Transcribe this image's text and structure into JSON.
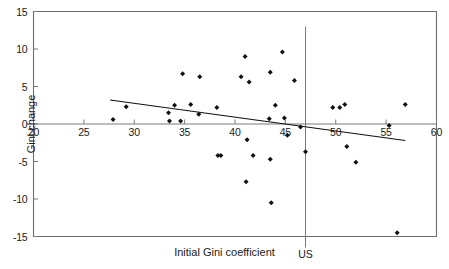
{
  "chart_data": {
    "type": "scatter",
    "title": "",
    "xlabel": "Initial Gini coefficient",
    "ylabel": "Gini change",
    "xlim": [
      20,
      60
    ],
    "ylim": [
      -15,
      15
    ],
    "xticks": [
      20,
      25,
      30,
      35,
      40,
      45,
      50,
      55,
      60
    ],
    "xtick_labels": [
      "20",
      "25",
      "30",
      "35",
      "40",
      "45",
      "50",
      "55",
      "60"
    ],
    "yticks": [
      15,
      10,
      5,
      0,
      -5,
      -10,
      -15
    ],
    "ytick_labels": [
      "15",
      "10",
      "5",
      "0",
      "-5",
      "-10",
      "-15"
    ],
    "grid": false,
    "legend": null,
    "marker": "diamond",
    "marker_color": "#111111",
    "axis_color": "#7a7a7a",
    "frame_color": "#6e6e6e",
    "text_color": "#1a1a1a",
    "points": [
      {
        "x": 27.9,
        "y": 0.6
      },
      {
        "x": 29.2,
        "y": 2.3
      },
      {
        "x": 33.4,
        "y": 1.5
      },
      {
        "x": 33.5,
        "y": 0.4
      },
      {
        "x": 34.0,
        "y": 2.5
      },
      {
        "x": 34.6,
        "y": 0.4
      },
      {
        "x": 34.8,
        "y": 6.7
      },
      {
        "x": 35.6,
        "y": 2.6
      },
      {
        "x": 36.4,
        "y": 1.3
      },
      {
        "x": 36.5,
        "y": 6.3
      },
      {
        "x": 38.2,
        "y": 2.2
      },
      {
        "x": 38.3,
        "y": -4.2
      },
      {
        "x": 38.6,
        "y": -4.2
      },
      {
        "x": 40.6,
        "y": 6.3
      },
      {
        "x": 41.0,
        "y": 9.0
      },
      {
        "x": 41.2,
        "y": -2.1
      },
      {
        "x": 41.4,
        "y": 5.6
      },
      {
        "x": 41.1,
        "y": -7.7
      },
      {
        "x": 41.8,
        "y": -4.2
      },
      {
        "x": 43.4,
        "y": 0.7
      },
      {
        "x": 43.5,
        "y": 6.9
      },
      {
        "x": 43.5,
        "y": -4.7
      },
      {
        "x": 43.6,
        "y": -10.5
      },
      {
        "x": 44.0,
        "y": 2.5
      },
      {
        "x": 44.7,
        "y": 9.6
      },
      {
        "x": 44.9,
        "y": 0.8
      },
      {
        "x": 45.2,
        "y": -1.5
      },
      {
        "x": 45.9,
        "y": 5.8
      },
      {
        "x": 46.5,
        "y": -0.4
      },
      {
        "x": 47.0,
        "y": -3.7
      },
      {
        "x": 49.7,
        "y": 2.2
      },
      {
        "x": 50.4,
        "y": 2.2
      },
      {
        "x": 50.9,
        "y": 2.6
      },
      {
        "x": 51.1,
        "y": -3.0
      },
      {
        "x": 52.0,
        "y": -5.1
      },
      {
        "x": 55.3,
        "y": -0.2
      },
      {
        "x": 56.1,
        "y": -14.5
      },
      {
        "x": 56.9,
        "y": 2.6
      }
    ],
    "trend_line": {
      "x_start": 27.6,
      "y_start": 3.2,
      "x_end": 56.9,
      "y_end": -2.2
    },
    "zero_line": {
      "y": 0
    },
    "reference_line": {
      "x": 47.0,
      "label": "US",
      "orientation": "vertical"
    }
  }
}
